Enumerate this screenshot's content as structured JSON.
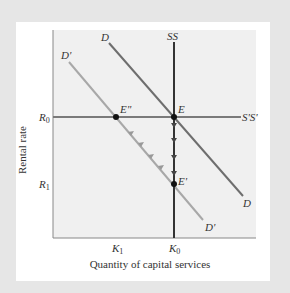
{
  "diagram": {
    "title": "",
    "axes": {
      "x_label": "Quantity of capital services",
      "y_label": "Rental rate",
      "x_ticks": [
        {
          "main": "K",
          "sub": "1",
          "x": 117
        },
        {
          "main": "K",
          "sub": "0",
          "x": 174
        }
      ],
      "y_ticks": [
        {
          "main": "R",
          "sub": "0",
          "y": 117
        },
        {
          "main": "R",
          "sub": "1",
          "y": 184
        }
      ]
    },
    "curves": {
      "D": {
        "start_label": "D",
        "end_label": "D"
      },
      "D_prime": {
        "start_label": "D'",
        "end_label": "D'"
      },
      "SS": {
        "label": "SS"
      },
      "S_prime_S_prime": {
        "label": "S'S'"
      }
    },
    "points": {
      "E": "E",
      "E_double_prime": "E\"",
      "E_prime": "E'"
    },
    "colors": {
      "outer_background": "#e6e6e6",
      "panel": "#ffffff",
      "plot_area": "#f0f0f0",
      "D_line": "#6e6e6e",
      "D_prime_line": "#a8a8a8",
      "SS_line": "#333333",
      "S_prime_S_prime_line": "#7a7a7a",
      "points": "#111111"
    }
  }
}
